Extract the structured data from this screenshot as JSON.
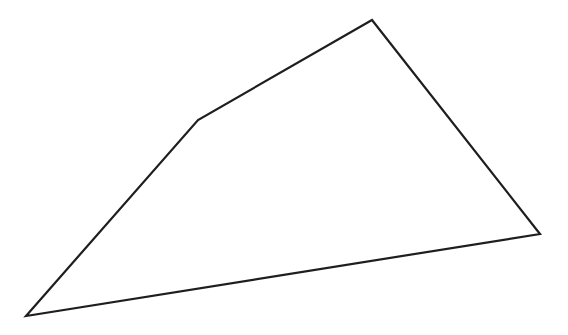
{
  "diagram": {
    "type": "polygon",
    "shape": "quadrilateral",
    "background": "#ffffff",
    "stroke": "#1e1e1e",
    "stroke_width": 2.2,
    "fill": "none",
    "vertices": [
      {
        "x": 26,
        "y": 316
      },
      {
        "x": 198,
        "y": 120
      },
      {
        "x": 372,
        "y": 20
      },
      {
        "x": 540,
        "y": 234
      }
    ]
  }
}
